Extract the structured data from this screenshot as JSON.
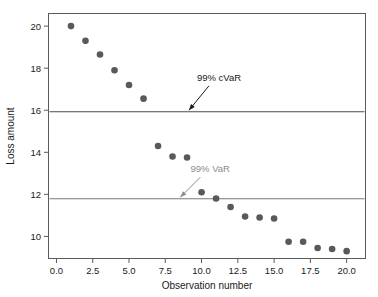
{
  "chart_data": {
    "type": "scatter",
    "title": "",
    "xlabel": "Observation number",
    "ylabel": "Loss amount",
    "xlim": [
      -0.55,
      21.3
    ],
    "ylim": [
      8.95,
      20.6
    ],
    "grid": false,
    "legend": "none",
    "x": [
      1,
      2,
      3,
      4,
      5,
      6,
      7,
      8,
      9,
      10,
      11,
      12,
      13,
      14,
      15,
      16,
      17,
      18,
      19,
      20
    ],
    "values": [
      20.0,
      19.3,
      18.65,
      17.9,
      17.2,
      16.55,
      14.3,
      13.8,
      13.75,
      12.1,
      11.8,
      11.4,
      10.95,
      10.9,
      10.85,
      9.75,
      9.75,
      9.45,
      9.4,
      9.3
    ],
    "xticks": [
      "0.0",
      "2.5",
      "5.0",
      "7.5",
      "10.0",
      "12.5",
      "15.0",
      "17.5",
      "20.0"
    ],
    "xtick_values": [
      0.0,
      2.5,
      5.0,
      7.5,
      10.0,
      12.5,
      15.0,
      17.5,
      20.0
    ],
    "yticks": [
      "10",
      "12",
      "14",
      "16",
      "18",
      "20"
    ],
    "ytick_values": [
      10,
      12,
      14,
      16,
      18,
      20
    ],
    "series_name": "Loss amount",
    "point_color": "#595959",
    "annotations": [
      {
        "label": "99% cVaR",
        "value": 15.93,
        "line_color": "#4d4d4d",
        "text_color": "#1a1a1a",
        "label_x": 11.2,
        "label_y": 17.4
      },
      {
        "label": "99% VaR",
        "value": 11.79,
        "line_color": "#7a7a7a",
        "text_color": "#8c8c8c",
        "label_x": 10.6,
        "label_y": 13.05
      }
    ]
  },
  "axis": {
    "x_title": "Observation number",
    "y_title": "Loss amount"
  }
}
